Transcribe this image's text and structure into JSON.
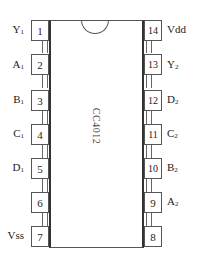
{
  "chip": {
    "name": "CC4012"
  },
  "pins_left": [
    {
      "num": "1",
      "label": "Y",
      "sub": "1"
    },
    {
      "num": "2",
      "label": "A",
      "sub": "1"
    },
    {
      "num": "3",
      "label": "B",
      "sub": "1"
    },
    {
      "num": "4",
      "label": "C",
      "sub": "1"
    },
    {
      "num": "5",
      "label": "D",
      "sub": "1"
    },
    {
      "num": "6",
      "label": "",
      "sub": ""
    },
    {
      "num": "7",
      "label": "Vss",
      "sub": ""
    }
  ],
  "pins_right": [
    {
      "num": "14",
      "label": "Vdd",
      "sub": ""
    },
    {
      "num": "13",
      "label": "Y",
      "sub": "2"
    },
    {
      "num": "12",
      "label": "D",
      "sub": "2"
    },
    {
      "num": "11",
      "label": "C",
      "sub": "2"
    },
    {
      "num": "10",
      "label": "B",
      "sub": "2"
    },
    {
      "num": "9",
      "label": "A",
      "sub": "2"
    },
    {
      "num": "8",
      "label": "",
      "sub": ""
    }
  ]
}
